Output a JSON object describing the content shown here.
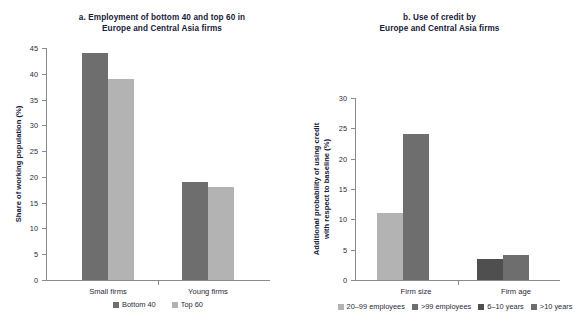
{
  "figure": {
    "background": "#ffffff",
    "colors": {
      "dark_gray": "#6e6e6e",
      "light_gray": "#b3b3b3",
      "axis": "#8a8a8a",
      "text": "#1a1a2e"
    }
  },
  "panel_a": {
    "title_line1": "a. Employment of bottom 40 and top 60 in",
    "title_line2": "Europe and Central Asia firms",
    "ylabel": "Share of working population (%)",
    "yticks": [
      "45",
      "40",
      "35",
      "30",
      "25",
      "20",
      "15",
      "10",
      "5",
      "0"
    ],
    "categories": [
      "Small firms",
      "Young firms"
    ],
    "legend": [
      {
        "label": "Bottom 40",
        "color": "#6e6e6e"
      },
      {
        "label": "Top 60",
        "color": "#b3b3b3"
      }
    ]
  },
  "panel_b": {
    "title_line1": "b. Use of credit by",
    "title_line2": "Europe and Central Asia firms",
    "ylabel_line1": "Additional probability of using credit",
    "ylabel_line2": "with respect to baseline (%)",
    "yticks": [
      "30",
      "25",
      "20",
      "15",
      "10",
      "5",
      "0"
    ],
    "categories": [
      "Firm size",
      "Firm age"
    ],
    "legend": [
      {
        "label": "20–99 employees",
        "color": "#b3b3b3"
      },
      {
        "label": ">99 employees",
        "color": "#6e6e6e"
      },
      {
        "label": "6–10 years",
        "color": "#4f4f4f"
      },
      {
        "label": ">10 years",
        "color": "#6e6e6e"
      }
    ]
  },
  "chart_data": [
    {
      "type": "bar",
      "panel": "a",
      "title": "a. Employment of bottom 40 and top 60 in Europe and Central Asia firms",
      "xlabel": "",
      "ylabel": "Share of working population (%)",
      "ylim": [
        0,
        45
      ],
      "ytick_step": 5,
      "grid": false,
      "legend_position": "bottom",
      "categories": [
        "Small firms",
        "Young firms"
      ],
      "series": [
        {
          "name": "Bottom 40",
          "color": "#6e6e6e",
          "values": [
            44,
            19
          ]
        },
        {
          "name": "Top 60",
          "color": "#b3b3b3",
          "values": [
            39,
            18
          ]
        }
      ]
    },
    {
      "type": "bar",
      "panel": "b",
      "title": "b. Use of credit by Europe and Central Asia firms",
      "xlabel": "",
      "ylabel": "Additional probability of using credit with respect to baseline (%)",
      "ylim": [
        0,
        30
      ],
      "ytick_step": 5,
      "grid": false,
      "legend_position": "bottom",
      "categories": [
        "Firm size",
        "Firm age"
      ],
      "bars": [
        {
          "category": "Firm size",
          "name": "20–99 employees",
          "color": "#b3b3b3",
          "value": 11
        },
        {
          "category": "Firm size",
          "name": ">99 employees",
          "color": "#6e6e6e",
          "value": 24
        },
        {
          "category": "Firm age",
          "name": "6–10 years",
          "color": "#4f4f4f",
          "value": 3.5
        },
        {
          "category": "Firm age",
          "name": ">10 years",
          "color": "#6e6e6e",
          "value": 4.2
        }
      ]
    }
  ]
}
